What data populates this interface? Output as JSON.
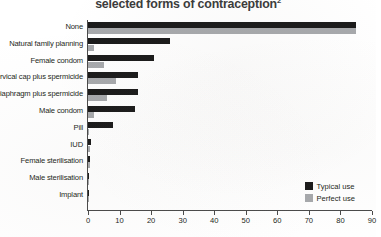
{
  "chart_data": {
    "type": "bar",
    "orientation": "horizontal",
    "title": "selected forms of contraception",
    "title_superscript": "2",
    "xlabel": "",
    "ylabel": "",
    "xlim": [
      0,
      90
    ],
    "xticks": [
      0,
      10,
      20,
      30,
      40,
      50,
      60,
      70,
      80,
      90
    ],
    "grid": false,
    "legend_position": "bottom-right",
    "categories": [
      "None",
      "Natural family planning",
      "Female condom",
      "Cervical cap plus spermicide",
      "Diaphragm plus spermicide",
      "Male condom",
      "Pill",
      "IUD",
      "Female sterilisation",
      "Male sterilisation",
      "Implant"
    ],
    "series": [
      {
        "name": "Typical use",
        "color": "#1a1a1a",
        "values": [
          85,
          26,
          21,
          16,
          16,
          15,
          8,
          0.8,
          0.5,
          0.15,
          0.05
        ]
      },
      {
        "name": "Perfect use",
        "color": "#a7a9ac",
        "values": [
          85,
          2,
          5,
          9,
          6,
          2,
          0.3,
          0.6,
          0.5,
          0.1,
          0.05
        ]
      }
    ]
  },
  "legend": {
    "items": [
      {
        "label": "Typical use",
        "color": "#1a1a1a"
      },
      {
        "label": "Perfect use",
        "color": "#a7a9ac"
      }
    ]
  }
}
